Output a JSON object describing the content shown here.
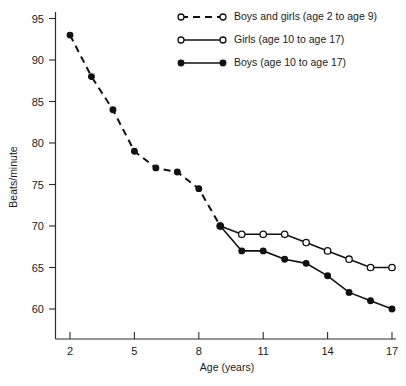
{
  "chart_data": {
    "type": "line",
    "title": "",
    "xlabel": "Age (years)",
    "ylabel": "Beats/minute",
    "xlim": [
      1.3,
      17.6
    ],
    "ylim": [
      57.5,
      95
    ],
    "grid": false,
    "legend_position": "top-right",
    "x_ticks": [
      2,
      5,
      8,
      11,
      14,
      17
    ],
    "y_ticks": [
      60,
      65,
      70,
      75,
      80,
      85,
      90,
      95
    ],
    "series": [
      {
        "name": "Boys and girls (age 2 to age 9)",
        "marker": "filled-circle",
        "linestyle": "dashed",
        "x": [
          2,
          3,
          4,
          5,
          6,
          7,
          8,
          9
        ],
        "values": [
          93,
          88,
          84,
          79,
          77,
          76.5,
          74.5,
          70
        ]
      },
      {
        "name": "Girls (age 10 to age 17)",
        "marker": "open-circle",
        "linestyle": "solid",
        "x": [
          9,
          10,
          11,
          12,
          13,
          14,
          15,
          16,
          17
        ],
        "values": [
          70,
          69,
          69,
          69,
          68,
          67,
          66,
          65,
          65
        ]
      },
      {
        "name": "Boys (age 10 to age 17)",
        "marker": "filled-circle",
        "linestyle": "solid",
        "x": [
          9,
          10,
          11,
          12,
          13,
          14,
          15,
          16,
          17
        ],
        "values": [
          70,
          67,
          67,
          66,
          65.5,
          64,
          62,
          61,
          60
        ]
      }
    ]
  },
  "axes": {
    "y_label": "Beats/minute",
    "x_label": "Age (years)",
    "y_tick_labels": [
      "95",
      "90",
      "85",
      "80",
      "75",
      "70",
      "65",
      "60"
    ],
    "x_tick_labels": [
      "2",
      "5",
      "8",
      "11",
      "14",
      "17"
    ]
  },
  "legend": {
    "entries": [
      {
        "label": "Boys and girls (age 2 to age 9)",
        "style": "dashed",
        "marker": "open-circle"
      },
      {
        "label": "Girls (age 10 to age 17)",
        "style": "solid",
        "marker": "open-circle"
      },
      {
        "label": "Boys (age 10 to age 17)",
        "style": "solid",
        "marker": "filled-circle"
      }
    ]
  },
  "colors": {
    "ink": "#111111",
    "background": "#ffffff"
  }
}
